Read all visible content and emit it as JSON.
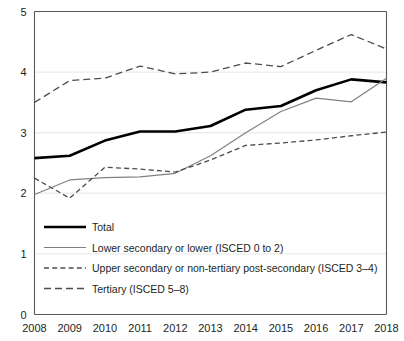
{
  "chart_data": {
    "type": "line",
    "title": "",
    "xlabel": "",
    "ylabel": "",
    "x": [
      2008,
      2009,
      2010,
      2011,
      2012,
      2013,
      2014,
      2015,
      2016,
      2017,
      2018
    ],
    "xtick_labels": [
      "2008",
      "2009",
      "2010",
      "2011",
      "2012",
      "2013",
      "2014",
      "2015",
      "2016",
      "2017",
      "2018"
    ],
    "ytick_labels": [
      "0",
      "1",
      "2",
      "3",
      "4",
      "5"
    ],
    "ytick_values": [
      0,
      1,
      2,
      3,
      4,
      5
    ],
    "ylim": [
      0,
      5
    ],
    "xlim": [
      2008,
      2018
    ],
    "grid": "horizontal",
    "legend_position": "inside-lower-left",
    "series": [
      {
        "name": "Total",
        "style": "solid-thick",
        "color": "#000000",
        "values": [
          2.58,
          2.62,
          2.87,
          3.02,
          3.02,
          3.11,
          3.38,
          3.44,
          3.7,
          3.88,
          3.83
        ]
      },
      {
        "name": "Lower secondary or lower (ISCED 0 to 2)",
        "style": "solid-thin",
        "color": "#808080",
        "values": [
          1.98,
          2.22,
          2.26,
          2.27,
          2.33,
          2.62,
          3.0,
          3.35,
          3.57,
          3.51,
          3.9
        ]
      },
      {
        "name": "Upper secondary or non-tertiary post-secondary (ISCED 3–4)",
        "style": "dashed-short",
        "color": "#4d4d4d",
        "values": [
          2.25,
          1.92,
          2.43,
          2.4,
          2.35,
          2.55,
          2.79,
          2.83,
          2.88,
          2.95,
          3.01
        ]
      },
      {
        "name": "Tertiary (ISCED 5–8)",
        "style": "dashed-long",
        "color": "#4d4d4d",
        "values": [
          3.5,
          3.86,
          3.9,
          4.1,
          3.97,
          4.0,
          4.15,
          4.09,
          4.36,
          4.62,
          4.38
        ]
      }
    ]
  },
  "legend": {
    "items": [
      {
        "label": "Total",
        "swatch": "solid-thick"
      },
      {
        "label": "Lower secondary or lower (ISCED 0 to 2)",
        "swatch": "solid-thin"
      },
      {
        "label": "Upper secondary or non-tertiary post-secondary (ISCED 3–4)",
        "swatch": "dashed-short"
      },
      {
        "label": "Tertiary (ISCED 5–8)",
        "swatch": "dashed-long"
      }
    ]
  },
  "colors": {
    "total_line": "#000000",
    "lower_secondary_line": "#808080",
    "dashed_line": "#4d4d4d",
    "axis": "#58595b",
    "gridline": "#eceded",
    "text": "#231f20",
    "background": "#ffffff"
  }
}
